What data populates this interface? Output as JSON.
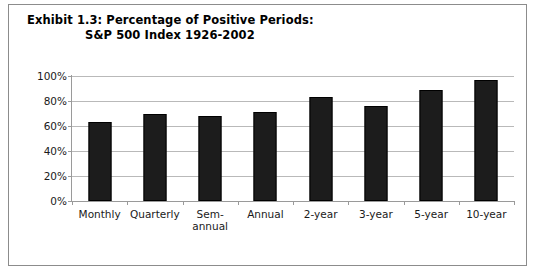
{
  "figure": {
    "title_line_1": "Exhibit 1.3: Percentage of Positive Periods:",
    "title_line_2": "S&P 500 Index 1926-2002",
    "border_color": "#8c8c8c",
    "background": "#ffffff"
  },
  "chart_data": {
    "type": "bar",
    "title": "Exhibit 1.3: Percentage of Positive Periods: S&P 500 Index 1926-2002",
    "xlabel": "",
    "ylabel": "",
    "categories": [
      "Monthly",
      "Quarterly",
      "Sem-\nannual",
      "Annual",
      "2-year",
      "3-year",
      "5-year",
      "10-year"
    ],
    "values": [
      63,
      70,
      68,
      71,
      83,
      76,
      89,
      97
    ],
    "ylim": [
      0,
      100
    ],
    "ytick_labels": [
      "100%",
      "80%",
      "60%",
      "40%",
      "20%",
      "0%"
    ],
    "ytick_values": [
      100,
      80,
      60,
      40,
      20,
      0
    ],
    "grid": true,
    "legend": "none",
    "bar_color": "#1c1c1c",
    "gridline_color": "#b9b9b9",
    "axis_color": "#9a9a9a"
  }
}
